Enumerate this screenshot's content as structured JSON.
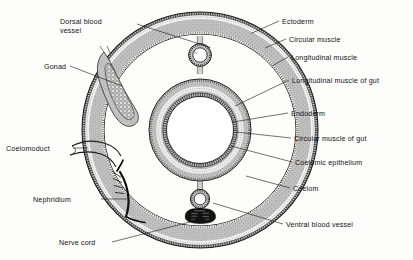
{
  "figure": {
    "background_color": "#fdfdfc",
    "ink_color": "#1a1a1a",
    "tissue_fill": "#b4b4b4"
  },
  "labels": {
    "dorsal_blood_vessel": "Dorsal blood",
    "dorsal_blood_vessel_line2": "vessel",
    "gonad": "Gonad",
    "coelomoduct": "Coelomoduct",
    "nephridium": "Nephridium",
    "nerve_cord": "Nerve cord",
    "ectoderm": "Ectoderm",
    "circular_muscle": "Circular muscle",
    "longitudinal_muscle": "Longitudinal muscle",
    "longitudinal_muscle_of_gut": "Longitudinal muscle of gut",
    "endoderm": "Endoderm",
    "circular_muscle_of_gut": "Circular muscle of gut",
    "coelomic_epithelium": "Coelomic epithelium",
    "coelom": "Coelom",
    "ventral_blood_vessel": "Ventral blood vessel"
  },
  "structures": {
    "body_wall": "body-wall-ring",
    "gut": "gut-ring",
    "dorsal_vessel": "dorsal-blood-vessel-lumen",
    "ventral_vessel": "ventral-blood-vessel-lumen",
    "nerve_cord_mass": "nerve-cord",
    "gonad_mass": "gonad-tissue",
    "nephridium_tubule": "nephridium-tubule",
    "coelomoduct_funnel": "coelomoduct-funnel",
    "mesentery_dorsal": "dorsal-mesentery",
    "mesentery_ventral": "ventral-mesentery"
  },
  "geometry": {
    "center_x": 200,
    "center_y": 130,
    "body_outer_radius": 118,
    "body_inner_radius": 96,
    "gut_outer_radius": 51,
    "gut_inner_radius": 32
  }
}
